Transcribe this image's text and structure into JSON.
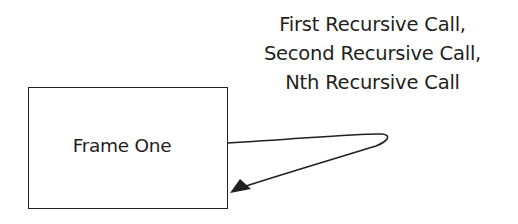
{
  "diagram": {
    "frame": {
      "label": "Frame One"
    },
    "recursion_label": {
      "lines": [
        "First Recursive Call,",
        "Second Recursive Call,",
        "Nth Recursive Call"
      ]
    },
    "arrow": {
      "type": "self-loop",
      "from": "frame-right-edge",
      "to": "frame-right-edge",
      "color": "#231f20"
    }
  }
}
